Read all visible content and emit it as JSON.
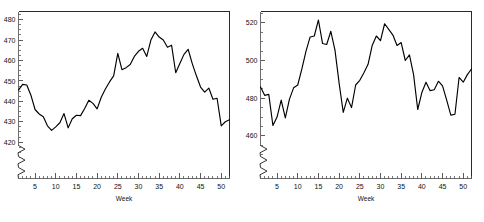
{
  "figure": {
    "background_color": "#ffffff",
    "line_color": "#000000",
    "frame_color": "#2a2a2a",
    "panel_count": 2
  },
  "chart_data": [
    {
      "type": "line",
      "title": "",
      "subtitle": "",
      "xlabel": "Week",
      "ylabel": "",
      "xlim": [
        1,
        52
      ],
      "ylim": [
        412,
        484
      ],
      "grid": false,
      "legend": null,
      "axis_break": true,
      "x_ticks": [
        5,
        10,
        15,
        20,
        25,
        30,
        35,
        40,
        45,
        50
      ],
      "x_tick_labels": [
        "5",
        "10",
        "15",
        "20",
        "25",
        "30",
        "35",
        "40",
        "45",
        "50"
      ],
      "x_minor_tick_step": 1,
      "y_ticks": [
        420,
        430,
        440,
        450,
        460,
        470,
        480
      ],
      "y_tick_labels": [
        "420",
        "430",
        "440",
        "450",
        "460",
        "470",
        "480"
      ],
      "y_minor_tick_step": 2.5,
      "x": [
        1,
        2,
        3,
        4,
        5,
        6,
        7,
        8,
        9,
        10,
        11,
        12,
        13,
        14,
        15,
        16,
        17,
        18,
        19,
        20,
        21,
        22,
        23,
        24,
        25,
        26,
        27,
        28,
        29,
        30,
        31,
        32,
        33,
        34,
        35,
        36,
        37,
        38,
        39,
        40,
        41,
        42,
        43,
        44,
        45,
        46,
        47,
        48,
        49,
        50,
        51,
        52
      ],
      "values": [
        445.5,
        448.3,
        448.0,
        443.0,
        436.0,
        433.8,
        432.5,
        428.0,
        425.8,
        427.5,
        429.5,
        434.0,
        427.0,
        431.5,
        433.2,
        433.0,
        436.5,
        440.5,
        439.0,
        436.3,
        442.0,
        446.0,
        449.5,
        452.5,
        463.5,
        455.5,
        456.5,
        458.0,
        462.0,
        464.5,
        466.0,
        462.0,
        470.0,
        474.0,
        471.5,
        470.0,
        466.5,
        467.5,
        454.0,
        458.5,
        463.0,
        465.5,
        458.5,
        452.5,
        447.0,
        444.5,
        446.5,
        441.0,
        441.5,
        428.0,
        430.0,
        431.0
      ],
      "series_name": "Series A"
    },
    {
      "type": "line",
      "title": "",
      "subtitle": "",
      "xlabel": "Week",
      "ylabel": "",
      "xlim": [
        1,
        52
      ],
      "ylim": [
        448,
        526
      ],
      "grid": false,
      "legend": null,
      "axis_break": true,
      "x_ticks": [
        5,
        10,
        15,
        20,
        25,
        30,
        35,
        40,
        45,
        50
      ],
      "x_tick_labels": [
        "5",
        "10",
        "15",
        "20",
        "25",
        "30",
        "35",
        "40",
        "45",
        "50"
      ],
      "x_minor_tick_step": 1,
      "y_ticks": [
        460,
        480,
        500,
        520
      ],
      "y_tick_labels": [
        "460",
        "480",
        "500",
        "520"
      ],
      "y_minor_tick_step": 5,
      "x": [
        1,
        2,
        3,
        4,
        5,
        6,
        7,
        8,
        9,
        10,
        11,
        12,
        13,
        14,
        15,
        16,
        17,
        18,
        19,
        20,
        21,
        22,
        23,
        24,
        25,
        26,
        27,
        28,
        29,
        30,
        31,
        32,
        33,
        34,
        35,
        36,
        37,
        38,
        39,
        40,
        41,
        42,
        43,
        44,
        45,
        46,
        47,
        48,
        49,
        50,
        51,
        52
      ],
      "values": [
        486.0,
        481.5,
        482.0,
        465.5,
        470.0,
        479.0,
        469.5,
        479.5,
        485.5,
        487.0,
        495.5,
        505.0,
        512.5,
        513.0,
        521.5,
        509.0,
        508.5,
        515.5,
        505.5,
        488.0,
        472.5,
        480.0,
        475.0,
        487.0,
        489.5,
        493.5,
        498.0,
        508.0,
        513.0,
        510.5,
        519.5,
        516.5,
        513.5,
        508.0,
        509.5,
        500.0,
        503.0,
        492.5,
        474.0,
        483.0,
        488.5,
        484.0,
        484.5,
        489.0,
        486.5,
        479.0,
        471.0,
        471.5,
        491.0,
        488.5,
        492.5,
        495.5
      ],
      "series_name": "Series B"
    }
  ],
  "panels": [
    {
      "name": "left-panel",
      "axis_title": "Week"
    },
    {
      "name": "right-panel",
      "axis_title": "Week"
    }
  ]
}
